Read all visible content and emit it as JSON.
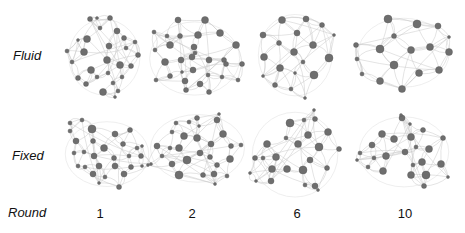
{
  "rows": [
    {
      "label": "Fluid"
    },
    {
      "label": "Fixed"
    }
  ],
  "axis_label": "Round",
  "columns": [
    {
      "label": "1",
      "x": 100
    },
    {
      "label": "2",
      "x": 192
    },
    {
      "label": "6",
      "x": 297
    },
    {
      "label": "10",
      "x": 405
    }
  ],
  "colors": {
    "node": "#6e6e6e",
    "node_stroke": "#555555",
    "edge": "#c8c8c8"
  },
  "panels": [
    {
      "id": "fluid-1",
      "nodes": [
        [
          90,
          19,
          2.5
        ],
        [
          110,
          18,
          2.5
        ],
        [
          100,
          28,
          2
        ],
        [
          117,
          31,
          3
        ],
        [
          87,
          39,
          3.5
        ],
        [
          124,
          38,
          2.5
        ],
        [
          109,
          46,
          3
        ],
        [
          126,
          48,
          2
        ],
        [
          84,
          52,
          3.5
        ],
        [
          138,
          55,
          2.5
        ],
        [
          67,
          51,
          2
        ],
        [
          72,
          62,
          2
        ],
        [
          107,
          60,
          3.5
        ],
        [
          120,
          65,
          3.5
        ],
        [
          91,
          70,
          3.5
        ],
        [
          131,
          66,
          2.5
        ],
        [
          78,
          78,
          2.5
        ],
        [
          97,
          77,
          2
        ],
        [
          108,
          73,
          2
        ],
        [
          86,
          84,
          2.5
        ],
        [
          113,
          83,
          2
        ],
        [
          122,
          77,
          2
        ],
        [
          103,
          92,
          3.5
        ],
        [
          118,
          91,
          2
        ],
        [
          115,
          97,
          1.5
        ],
        [
          78,
          40,
          1.5
        ],
        [
          97,
          18,
          1.5
        ],
        [
          135,
          42,
          2
        ]
      ]
    },
    {
      "id": "fluid-2",
      "nodes": [
        [
          178,
          20,
          3
        ],
        [
          205,
          20,
          3.5
        ],
        [
          154,
          32,
          2
        ],
        [
          167,
          36,
          2
        ],
        [
          180,
          36,
          2.5
        ],
        [
          198,
          35,
          3.5
        ],
        [
          220,
          33,
          3.5
        ],
        [
          170,
          45,
          3.5
        ],
        [
          194,
          47,
          3
        ],
        [
          236,
          45,
          3.5
        ],
        [
          155,
          50,
          2
        ],
        [
          195,
          53,
          2
        ],
        [
          192,
          57,
          3
        ],
        [
          224,
          60,
          2.5
        ],
        [
          165,
          62,
          3.5
        ],
        [
          181,
          60,
          3
        ],
        [
          209,
          60,
          3
        ],
        [
          226,
          64,
          2.5
        ],
        [
          242,
          64,
          2.5
        ],
        [
          193,
          70,
          3
        ],
        [
          208,
          75,
          2
        ],
        [
          170,
          76,
          2.5
        ],
        [
          182,
          72,
          1.5
        ],
        [
          222,
          77,
          2
        ],
        [
          185,
          81,
          3
        ],
        [
          200,
          84,
          3
        ],
        [
          156,
          80,
          2
        ],
        [
          186,
          90,
          2.5
        ],
        [
          209,
          92,
          2.5
        ],
        [
          238,
          80,
          2
        ]
      ]
    },
    {
      "id": "fluid-3",
      "nodes": [
        [
          282,
          20,
          3.5
        ],
        [
          306,
          19,
          3
        ],
        [
          322,
          25,
          2.5
        ],
        [
          263,
          35,
          3
        ],
        [
          297,
          33,
          3
        ],
        [
          279,
          43,
          2.5
        ],
        [
          313,
          45,
          3.5
        ],
        [
          334,
          35,
          1.5
        ],
        [
          294,
          52,
          3.5
        ],
        [
          264,
          57,
          3.5
        ],
        [
          303,
          62,
          2
        ],
        [
          329,
          58,
          4
        ],
        [
          280,
          68,
          3.5
        ],
        [
          314,
          75,
          4
        ],
        [
          295,
          73,
          1.5
        ],
        [
          263,
          76,
          1.5
        ],
        [
          275,
          85,
          2.5
        ],
        [
          291,
          89,
          2
        ],
        [
          305,
          98,
          1.5
        ]
      ]
    },
    {
      "id": "fluid-4",
      "nodes": [
        [
          388,
          19,
          4
        ],
        [
          417,
          24,
          4
        ],
        [
          438,
          26,
          3
        ],
        [
          394,
          36,
          2.5
        ],
        [
          380,
          49,
          4
        ],
        [
          411,
          50,
          3.5
        ],
        [
          430,
          47,
          3.5
        ],
        [
          356,
          45,
          2.5
        ],
        [
          449,
          52,
          3.5
        ],
        [
          357,
          59,
          2
        ],
        [
          394,
          65,
          4
        ],
        [
          419,
          73,
          3.5
        ],
        [
          439,
          70,
          3.5
        ],
        [
          362,
          74,
          2
        ],
        [
          380,
          81,
          3.5
        ],
        [
          402,
          89,
          3.5
        ],
        [
          449,
          37,
          1.5
        ]
      ]
    },
    {
      "id": "fixed-1",
      "nodes": [
        [
          70,
          123,
          2
        ],
        [
          82,
          120,
          2
        ],
        [
          70,
          131,
          2
        ],
        [
          92,
          129,
          4
        ],
        [
          76,
          141,
          3
        ],
        [
          93,
          141,
          2.5
        ],
        [
          115,
          134,
          3
        ],
        [
          104,
          148,
          3.5
        ],
        [
          123,
          144,
          2.5
        ],
        [
          130,
          130,
          2.5
        ],
        [
          74,
          153,
          2
        ],
        [
          84,
          152,
          2
        ],
        [
          94,
          156,
          3
        ],
        [
          114,
          158,
          2.5
        ],
        [
          129,
          156,
          2
        ],
        [
          137,
          148,
          2
        ],
        [
          78,
          166,
          2
        ],
        [
          85,
          167,
          2
        ],
        [
          99,
          166,
          3
        ],
        [
          115,
          166,
          3
        ],
        [
          131,
          167,
          2.5
        ],
        [
          141,
          156,
          2.5
        ],
        [
          93,
          174,
          3
        ],
        [
          105,
          177,
          2
        ],
        [
          124,
          174,
          3
        ],
        [
          99,
          183,
          1.5
        ],
        [
          119,
          187,
          2.5
        ],
        [
          142,
          166,
          1.5
        ],
        [
          151,
          164,
          1.5
        ],
        [
          142,
          146,
          1.5
        ]
      ]
    },
    {
      "id": "fixed-2",
      "nodes": [
        [
          197,
          118,
          2.5
        ],
        [
          176,
          123,
          2
        ],
        [
          189,
          122,
          2
        ],
        [
          217,
          120,
          3
        ],
        [
          199,
          126,
          1.5
        ],
        [
          172,
          132,
          2
        ],
        [
          184,
          136,
          3.5
        ],
        [
          197,
          138,
          3.5
        ],
        [
          223,
          134,
          3.5
        ],
        [
          157,
          146,
          3
        ],
        [
          170,
          148,
          2
        ],
        [
          179,
          148,
          3.5
        ],
        [
          211,
          144,
          3
        ],
        [
          231,
          146,
          2.5
        ],
        [
          241,
          145,
          2
        ],
        [
          162,
          156,
          2
        ],
        [
          200,
          153,
          3
        ],
        [
          210,
          157,
          2.5
        ],
        [
          230,
          159,
          3.5
        ],
        [
          187,
          160,
          4
        ],
        [
          172,
          164,
          3
        ],
        [
          217,
          165,
          2.5
        ],
        [
          148,
          165,
          1.5
        ],
        [
          179,
          175,
          4
        ],
        [
          203,
          175,
          2.5
        ],
        [
          214,
          174,
          3
        ],
        [
          227,
          176,
          2
        ],
        [
          215,
          184,
          1.5
        ],
        [
          219,
          114,
          1.5
        ]
      ]
    },
    {
      "id": "fixed-3",
      "nodes": [
        [
          290,
          123,
          4
        ],
        [
          304,
          120,
          2
        ],
        [
          315,
          119,
          2.5
        ],
        [
          314,
          110,
          1.5
        ],
        [
          286,
          138,
          2
        ],
        [
          308,
          135,
          3.5
        ],
        [
          328,
          132,
          3.5
        ],
        [
          298,
          144,
          3.5
        ],
        [
          319,
          147,
          4
        ],
        [
          339,
          149,
          2.5
        ],
        [
          267,
          144,
          3.5
        ],
        [
          276,
          157,
          3.5
        ],
        [
          263,
          158,
          2
        ],
        [
          255,
          158,
          2.5
        ],
        [
          310,
          160,
          3
        ],
        [
          327,
          168,
          2.5
        ],
        [
          272,
          169,
          3.5
        ],
        [
          287,
          169,
          3.5
        ],
        [
          303,
          170,
          4
        ],
        [
          250,
          173,
          1.5
        ],
        [
          271,
          181,
          3
        ],
        [
          256,
          181,
          1.5
        ],
        [
          305,
          185,
          2
        ],
        [
          315,
          186,
          3
        ],
        [
          318,
          190,
          1.5
        ]
      ]
    },
    {
      "id": "fixed-4",
      "nodes": [
        [
          402,
          118,
          3
        ],
        [
          410,
          124,
          1.5
        ],
        [
          423,
          130,
          2.5
        ],
        [
          382,
          134,
          3.5
        ],
        [
          394,
          139,
          3.5
        ],
        [
          411,
          137,
          3.5
        ],
        [
          443,
          138,
          2.5
        ],
        [
          372,
          145,
          3
        ],
        [
          416,
          147,
          2
        ],
        [
          429,
          149,
          3.5
        ],
        [
          360,
          153,
          2
        ],
        [
          386,
          156,
          3.5
        ],
        [
          405,
          152,
          3
        ],
        [
          374,
          158,
          2
        ],
        [
          357,
          160,
          1.5
        ],
        [
          422,
          162,
          3.5
        ],
        [
          441,
          164,
          3.5
        ],
        [
          368,
          167,
          2
        ],
        [
          413,
          165,
          2
        ],
        [
          383,
          171,
          3.5
        ],
        [
          411,
          175,
          3.5
        ],
        [
          426,
          175,
          4
        ],
        [
          448,
          177,
          1.5
        ],
        [
          424,
          186,
          2.5
        ],
        [
          401,
          115,
          1.5
        ]
      ]
    }
  ]
}
